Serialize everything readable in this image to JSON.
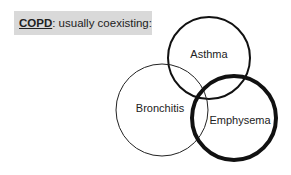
{
  "header": {
    "key_term": "COPD",
    "description": ": usually coexisting:",
    "box_color": "#d9d9d9"
  },
  "diagram": {
    "type": "venn",
    "sets": [
      {
        "label": "Asthma",
        "cx": 209,
        "cy": 58,
        "r": 41,
        "stroke_width": 2
      },
      {
        "label": "Bronchitis",
        "cx": 162,
        "cy": 110,
        "r": 46,
        "stroke_width": 1
      },
      {
        "label": "Emphysema",
        "cx": 234,
        "cy": 118,
        "r": 42,
        "stroke_width": 4
      }
    ],
    "stroke_color": "#111111"
  }
}
